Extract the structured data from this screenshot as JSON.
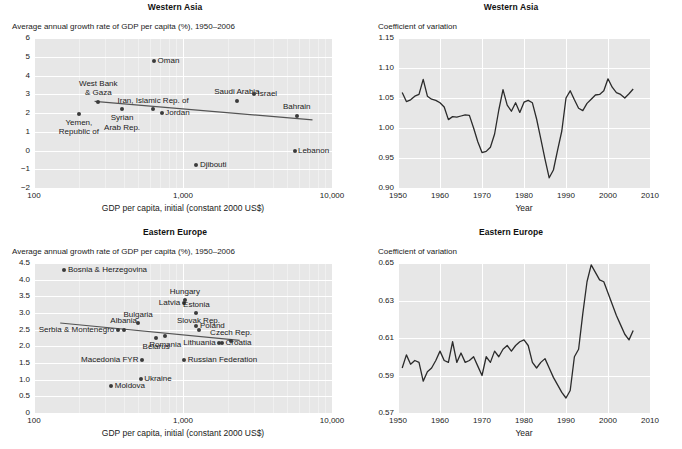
{
  "figure": {
    "panels": [
      {
        "id": "western-asia-scatter",
        "title": "Western Asia",
        "ylabel": "Average annual growth rate of GDP per capita (%), 1950–2006",
        "xlabel": "GDP per capita, initial (constant 2000 US$)"
      },
      {
        "id": "western-asia-cv",
        "title": "Western Asia",
        "ylabel": "Coefficient of variation",
        "xlabel": "Year"
      },
      {
        "id": "eastern-europe-scatter",
        "title": "Eastern Europe",
        "ylabel": "Average annual growth rate of GDP per capita (%), 1950–2006",
        "xlabel": "GDP per capita, initial (constant 2000 US$)"
      },
      {
        "id": "eastern-europe-cv",
        "title": "Eastern Europe",
        "ylabel": "Coefficient of variation",
        "xlabel": "Year"
      }
    ]
  },
  "chart_data": [
    {
      "type": "scatter",
      "id": "western-asia-scatter",
      "title": "Western Asia",
      "xlabel": "GDP per capita, initial (constant 2000 US$)",
      "ylabel": "Average annual growth rate of GDP per capita (%), 1950–2006",
      "xscale": "log",
      "xlim": [
        100,
        10000
      ],
      "ylim": [
        -2,
        6
      ],
      "xticks": [
        100,
        1000,
        10000
      ],
      "xticklabels": [
        "100",
        "1,000",
        "10,000"
      ],
      "yticks": [
        -2,
        -1,
        0,
        1,
        2,
        3,
        4,
        5,
        6
      ],
      "yticklabels": [
        "−2",
        "−1",
        "0",
        "1",
        "2",
        "3",
        "4",
        "5",
        "6"
      ],
      "grid": true,
      "points": [
        {
          "label": "Yemen,\nRepublic of",
          "x": 200,
          "y": 1.95,
          "lpos": "below"
        },
        {
          "label": "West Bank\n& Gaza",
          "x": 270,
          "y": 2.6,
          "lpos": "above"
        },
        {
          "label": "Syrian\nArab Rep.",
          "x": 390,
          "y": 2.2,
          "lpos": "below"
        },
        {
          "label": "Oman",
          "x": 640,
          "y": 4.75,
          "lpos": "right"
        },
        {
          "label": "Iran, Islamic Rep. of",
          "x": 630,
          "y": 2.2,
          "lpos": "above"
        },
        {
          "label": "Jordan",
          "x": 720,
          "y": 2.0,
          "lpos": "right"
        },
        {
          "label": "Djibouti",
          "x": 1230,
          "y": -0.75,
          "lpos": "right"
        },
        {
          "label": "Saudi Arabia",
          "x": 2300,
          "y": 2.65,
          "lpos": "above"
        },
        {
          "label": "Israel",
          "x": 3000,
          "y": 3.0,
          "lpos": "right"
        },
        {
          "label": "Bahrain",
          "x": 5800,
          "y": 1.85,
          "lpos": "above"
        },
        {
          "label": "Lebanon",
          "x": 5600,
          "y": 0.0,
          "lpos": "right"
        }
      ],
      "trendline": {
        "x0": 255,
        "y0": 2.62,
        "x1": 7400,
        "y1": 1.63
      }
    },
    {
      "type": "line",
      "id": "western-asia-cv",
      "title": "Western Asia",
      "xlabel": "Year",
      "ylabel": "Coefficient of variation",
      "xlim": [
        1950,
        2010
      ],
      "ylim": [
        0.9,
        1.15
      ],
      "xticks": [
        1950,
        1960,
        1970,
        1980,
        1990,
        2000,
        2010
      ],
      "xticklabels": [
        "1950",
        "1960",
        "1970",
        "1980",
        "1990",
        "2000",
        "2010"
      ],
      "yticks": [
        0.9,
        0.95,
        1.0,
        1.05,
        1.1,
        1.15
      ],
      "yticklabels": [
        "0.90",
        "0.95",
        "1.00",
        "1.05",
        "1.10",
        "1.15"
      ],
      "grid": true,
      "x": [
        1951,
        1952,
        1953,
        1954,
        1955,
        1956,
        1957,
        1958,
        1959,
        1960,
        1961,
        1962,
        1963,
        1964,
        1965,
        1966,
        1967,
        1968,
        1969,
        1970,
        1971,
        1972,
        1973,
        1974,
        1975,
        1976,
        1977,
        1978,
        1979,
        1980,
        1981,
        1982,
        1983,
        1984,
        1985,
        1986,
        1987,
        1988,
        1989,
        1990,
        1991,
        1992,
        1993,
        1994,
        1995,
        1996,
        1997,
        1998,
        1999,
        2000,
        2001,
        2002,
        2003,
        2004,
        2005,
        2006
      ],
      "y": [
        1.059,
        1.044,
        1.047,
        1.053,
        1.056,
        1.081,
        1.053,
        1.048,
        1.046,
        1.042,
        1.035,
        1.014,
        1.019,
        1.018,
        1.02,
        1.022,
        1.021,
        1.0,
        0.977,
        0.959,
        0.961,
        0.968,
        0.99,
        1.03,
        1.064,
        1.038,
        1.028,
        1.042,
        1.026,
        1.043,
        1.046,
        1.042,
        1.015,
        0.982,
        0.948,
        0.917,
        0.93,
        0.963,
        0.995,
        1.05,
        1.062,
        1.047,
        1.033,
        1.029,
        1.041,
        1.048,
        1.055,
        1.056,
        1.062,
        1.082,
        1.068,
        1.059,
        1.056,
        1.05,
        1.057,
        1.065
      ]
    },
    {
      "type": "scatter",
      "id": "eastern-europe-scatter",
      "title": "Eastern Europe",
      "xlabel": "GDP per capita, initial (constant 2000 US$)",
      "ylabel": "Average annual growth rate of GDP per capita (%), 1950–2006",
      "xscale": "log",
      "xlim": [
        100,
        10000
      ],
      "ylim": [
        0,
        4.5
      ],
      "xticks": [
        100,
        1000,
        10000
      ],
      "xticklabels": [
        "100",
        "1,000",
        "10,000"
      ],
      "yticks": [
        0,
        0.5,
        1.0,
        1.5,
        2.0,
        2.5,
        3.0,
        3.5,
        4.0,
        4.5
      ],
      "yticklabels": [
        "0",
        "0.5",
        "1.0",
        "1.5",
        "2.0",
        "2.5",
        "3.0",
        "3.5",
        "4.0",
        "4.5"
      ],
      "grid": true,
      "points": [
        {
          "label": "Bosnia & Herzegovina",
          "x": 160,
          "y": 4.28,
          "lpos": "right"
        },
        {
          "label": "Moldova",
          "x": 330,
          "y": 0.82,
          "lpos": "right"
        },
        {
          "label": "Serbia & Montenegro",
          "x": 365,
          "y": 2.5,
          "lpos": "left"
        },
        {
          "label": "Albania",
          "x": 400,
          "y": 2.5,
          "lpos": "above"
        },
        {
          "label": "Macedonia FYR",
          "x": 530,
          "y": 1.58,
          "lpos": "left"
        },
        {
          "label": "Ukraine",
          "x": 520,
          "y": 1.02,
          "lpos": "right"
        },
        {
          "label": "Bulgaria",
          "x": 500,
          "y": 2.7,
          "lpos": "above"
        },
        {
          "label": "Belarus",
          "x": 660,
          "y": 2.24,
          "lpos": "below"
        },
        {
          "label": "Romania",
          "x": 760,
          "y": 2.3,
          "lpos": "below"
        },
        {
          "label": "Latvia",
          "x": 1010,
          "y": 3.3,
          "lpos": "left"
        },
        {
          "label": "Hungary",
          "x": 1030,
          "y": 3.38,
          "lpos": "above"
        },
        {
          "label": "Russian Federation",
          "x": 1020,
          "y": 1.58,
          "lpos": "right"
        },
        {
          "label": "Estonia",
          "x": 1230,
          "y": 3.0,
          "lpos": "above"
        },
        {
          "label": "Poland",
          "x": 1230,
          "y": 2.62,
          "lpos": "right"
        },
        {
          "label": "Slovak Rep.",
          "x": 1270,
          "y": 2.5,
          "lpos": "above"
        },
        {
          "label": "Lithuania",
          "x": 1750,
          "y": 2.1,
          "lpos": "left"
        },
        {
          "label": "Croatia",
          "x": 1830,
          "y": 2.1,
          "lpos": "right"
        },
        {
          "label": "Czech Rep.",
          "x": 2100,
          "y": 2.16,
          "lpos": "above"
        }
      ],
      "trendline": {
        "x0": 150,
        "y0": 2.7,
        "x1": 2400,
        "y1": 2.18
      }
    },
    {
      "type": "line",
      "id": "eastern-europe-cv",
      "title": "Eastern Europe",
      "xlabel": "Year",
      "ylabel": "Coefficient of variation",
      "xlim": [
        1950,
        2010
      ],
      "ylim": [
        0.57,
        0.65
      ],
      "xticks": [
        1950,
        1960,
        1970,
        1980,
        1990,
        2000,
        2010
      ],
      "xticklabels": [
        "1950",
        "1960",
        "1970",
        "1980",
        "1990",
        "2000",
        "2010"
      ],
      "yticks": [
        0.57,
        0.59,
        0.61,
        0.63,
        0.65
      ],
      "yticklabels": [
        "0.57",
        "0.59",
        "0.61",
        "0.63",
        "0.65"
      ],
      "grid": true,
      "x": [
        1951,
        1952,
        1953,
        1954,
        1955,
        1956,
        1957,
        1958,
        1959,
        1960,
        1961,
        1962,
        1963,
        1964,
        1965,
        1966,
        1967,
        1968,
        1969,
        1970,
        1971,
        1972,
        1973,
        1974,
        1975,
        1976,
        1977,
        1978,
        1979,
        1980,
        1981,
        1982,
        1983,
        1984,
        1985,
        1986,
        1987,
        1988,
        1989,
        1990,
        1991,
        1992,
        1993,
        1994,
        1995,
        1996,
        1997,
        1998,
        1999,
        2000,
        2001,
        2002,
        2003,
        2004,
        2005,
        2006
      ],
      "y": [
        0.594,
        0.601,
        0.596,
        0.598,
        0.597,
        0.587,
        0.592,
        0.594,
        0.598,
        0.603,
        0.598,
        0.597,
        0.608,
        0.597,
        0.602,
        0.597,
        0.598,
        0.6,
        0.595,
        0.59,
        0.6,
        0.597,
        0.603,
        0.6,
        0.604,
        0.606,
        0.603,
        0.606,
        0.608,
        0.609,
        0.606,
        0.597,
        0.594,
        0.597,
        0.599,
        0.594,
        0.589,
        0.585,
        0.581,
        0.578,
        0.582,
        0.6,
        0.604,
        0.623,
        0.64,
        0.649,
        0.645,
        0.641,
        0.64,
        0.634,
        0.628,
        0.622,
        0.617,
        0.612,
        0.609,
        0.614
      ]
    }
  ]
}
